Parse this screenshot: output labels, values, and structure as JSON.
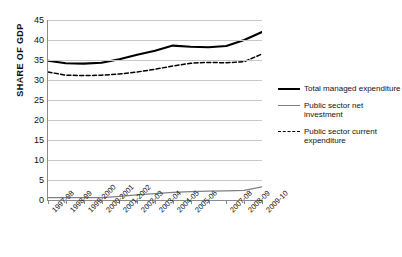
{
  "axis": {
    "ylabel": "SHARE OF GDP",
    "yticks": [
      "0",
      "5",
      "10",
      "15",
      "20",
      "25",
      "30",
      "35",
      "40",
      "45"
    ],
    "xlabels": [
      "1997-98",
      "1998-99",
      "1999-2000",
      "2000-2001",
      "2001-2002",
      "2002-03",
      "2003-04",
      "2004-05",
      "2005-06",
      "",
      "2007-08",
      "2008-09",
      "2009-10"
    ]
  },
  "legend": {
    "items": [
      {
        "label": "Total managed expenditure",
        "style": "solid-bold",
        "color": "#000000"
      },
      {
        "label": "Public sector net investment",
        "style": "solid-thin",
        "color": "#808080"
      },
      {
        "label": "Public sector current expenditure",
        "style": "dashed",
        "color": "#000000"
      }
    ]
  },
  "chart_data": {
    "type": "line",
    "title": "",
    "xlabel": "",
    "ylabel": "SHARE OF GDP",
    "ylim": [
      0,
      45
    ],
    "ytick_step": 5,
    "grid": "horizontal",
    "legend_position": "right",
    "categories": [
      "1997-98",
      "1998-99",
      "1999-2000",
      "2000-2001",
      "2001-2002",
      "2002-03",
      "2003-04",
      "2004-05",
      "2005-06",
      "2006-07",
      "2007-08",
      "2008-09",
      "2009-10"
    ],
    "series": [
      {
        "name": "Total managed expenditure",
        "style": "solid-bold",
        "color": "#000000",
        "values": [
          34.8,
          34.2,
          34.1,
          34.3,
          35.2,
          36.3,
          37.3,
          38.6,
          38.3,
          38.2,
          38.5,
          40.0,
          42.0
        ]
      },
      {
        "name": "Public sector net investment",
        "style": "solid-thin",
        "color": "#808080",
        "values": [
          0.6,
          0.6,
          0.6,
          0.6,
          0.9,
          1.3,
          1.6,
          1.9,
          2.1,
          2.2,
          2.3,
          2.4,
          3.3
        ]
      },
      {
        "name": "Public sector current expenditure",
        "style": "dashed",
        "color": "#000000",
        "values": [
          32.0,
          31.2,
          31.1,
          31.2,
          31.5,
          32.0,
          32.7,
          33.5,
          34.2,
          34.4,
          34.3,
          34.6,
          36.5
        ]
      }
    ]
  }
}
